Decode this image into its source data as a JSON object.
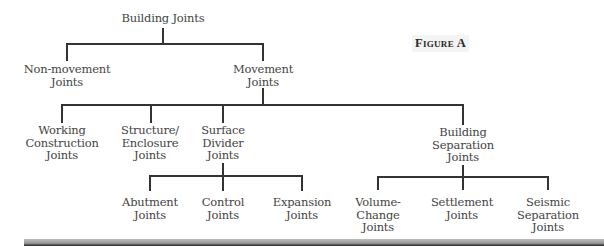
{
  "figure_label": "Figure A",
  "tree": {
    "root": {
      "line1": "Building Joints"
    },
    "level1": {
      "non_movement": {
        "line1": "Non-movement",
        "line2": "Joints"
      },
      "movement": {
        "line1": "Movement",
        "line2": "Joints"
      }
    },
    "level2": {
      "working": {
        "line1": "Working",
        "line2": "Construction",
        "line3": "Joints"
      },
      "structure": {
        "line1": "Structure/",
        "line2": "Enclosure",
        "line3": "Joints"
      },
      "surface": {
        "line1": "Surface",
        "line2": "Divider",
        "line3": "Joints"
      },
      "building_sep": {
        "line1": "Building",
        "line2": "Separation",
        "line3": "Joints"
      }
    },
    "level3": {
      "abutment": {
        "line1": "Abutment",
        "line2": "Joints"
      },
      "control": {
        "line1": "Control",
        "line2": "Joints"
      },
      "expansion": {
        "line1": "Expansion",
        "line2": "Joints"
      },
      "volume_change": {
        "line1": "Volume-",
        "line2": "Change",
        "line3": "Joints"
      },
      "settlement": {
        "line1": "Settlement",
        "line2": "Joints"
      },
      "seismic": {
        "line1": "Seismic",
        "line2": "Separation",
        "line3": "Joints"
      }
    }
  },
  "colors": {
    "line": "#333333",
    "text": "#444444"
  }
}
